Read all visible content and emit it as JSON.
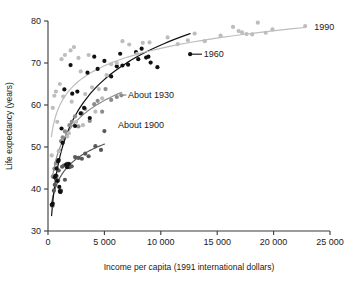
{
  "chart_data": {
    "type": "scatter",
    "title": "",
    "subtitle": "",
    "xlabel": "Income per capita (1991 international dollars)",
    "ylabel": "Life expectancy (years)",
    "xlim": [
      0,
      25000
    ],
    "ylim": [
      30,
      80
    ],
    "xticks": [
      0,
      5000,
      10000,
      15000,
      20000,
      25000
    ],
    "xticklabels": [
      "0",
      "5 000",
      "10 000",
      "15 000",
      "20 000",
      "25 000"
    ],
    "yticks": [
      30,
      40,
      50,
      60,
      70,
      80
    ],
    "yticklabels": [
      "30",
      "40",
      "50",
      "60",
      "70",
      "80"
    ],
    "grid": false,
    "legend_position": "inline-annotations",
    "annotations": [
      {
        "text": "1990",
        "x": 23600,
        "y": 78.6,
        "color": "#9a9a9a"
      },
      {
        "text": "1960",
        "x": 13800,
        "y": 72.1,
        "color": "#111111"
      },
      {
        "text": "About 1930",
        "x": 7100,
        "y": 62.4,
        "color": "#6e6e6e"
      },
      {
        "text": "About 1900",
        "x": 6200,
        "y": 55.2,
        "color": "#595959"
      }
    ],
    "series": [
      {
        "name": "About 1900",
        "color": "#595959",
        "marker": "circle",
        "curve_label": "About 1900",
        "curve_fit": "logarithmic",
        "points": [
          {
            "x": 330,
            "y": 36.3
          },
          {
            "x": 400,
            "y": 36.0
          },
          {
            "x": 520,
            "y": 39.6
          },
          {
            "x": 600,
            "y": 41.0
          },
          {
            "x": 700,
            "y": 42.4
          },
          {
            "x": 760,
            "y": 43.1
          },
          {
            "x": 900,
            "y": 42.0
          },
          {
            "x": 950,
            "y": 44.4
          },
          {
            "x": 1100,
            "y": 39.3
          },
          {
            "x": 1150,
            "y": 39.6
          },
          {
            "x": 1250,
            "y": 45.3
          },
          {
            "x": 1400,
            "y": 45.6
          },
          {
            "x": 1500,
            "y": 42.2
          },
          {
            "x": 1700,
            "y": 46.0
          },
          {
            "x": 1900,
            "y": 45.2
          },
          {
            "x": 2100,
            "y": 45.4
          },
          {
            "x": 2400,
            "y": 47.6
          },
          {
            "x": 2700,
            "y": 47.4
          },
          {
            "x": 3000,
            "y": 47.2
          },
          {
            "x": 3300,
            "y": 48.4
          },
          {
            "x": 3600,
            "y": 47.8
          },
          {
            "x": 4200,
            "y": 50.2
          },
          {
            "x": 4700,
            "y": 49.3
          },
          {
            "x": 5000,
            "y": 53.8
          }
        ]
      },
      {
        "name": "About 1930",
        "color": "#8c8c8c",
        "marker": "circle",
        "curve_label": "About 1930",
        "curve_fit": "logarithmic",
        "points": [
          {
            "x": 420,
            "y": 43.0
          },
          {
            "x": 560,
            "y": 44.8
          },
          {
            "x": 700,
            "y": 46.1
          },
          {
            "x": 850,
            "y": 46.8
          },
          {
            "x": 1000,
            "y": 49.1
          },
          {
            "x": 1150,
            "y": 51.4
          },
          {
            "x": 1300,
            "y": 52.3
          },
          {
            "x": 1500,
            "y": 53.7
          },
          {
            "x": 1700,
            "y": 53.1
          },
          {
            "x": 1900,
            "y": 55.2
          },
          {
            "x": 2100,
            "y": 56.0
          },
          {
            "x": 2400,
            "y": 57.3
          },
          {
            "x": 2700,
            "y": 54.9
          },
          {
            "x": 3000,
            "y": 58.0
          },
          {
            "x": 3300,
            "y": 59.1
          },
          {
            "x": 3700,
            "y": 56.2
          },
          {
            "x": 4100,
            "y": 60.2
          },
          {
            "x": 4400,
            "y": 61.0
          },
          {
            "x": 4800,
            "y": 58.4
          },
          {
            "x": 5100,
            "y": 63.8
          },
          {
            "x": 5600,
            "y": 61.2
          },
          {
            "x": 6100,
            "y": 61.9
          },
          {
            "x": 6500,
            "y": 62.3
          }
        ]
      },
      {
        "name": "1960",
        "color": "#111111",
        "marker": "circle",
        "curve_label": "1960",
        "curve_fit": "logarithmic",
        "points": [
          {
            "x": 350,
            "y": 36.2
          },
          {
            "x": 420,
            "y": 36.5
          },
          {
            "x": 600,
            "y": 42.8
          },
          {
            "x": 680,
            "y": 43.2
          },
          {
            "x": 760,
            "y": 44.9
          },
          {
            "x": 820,
            "y": 41.9
          },
          {
            "x": 900,
            "y": 46.6
          },
          {
            "x": 950,
            "y": 46.9
          },
          {
            "x": 1000,
            "y": 40.5
          },
          {
            "x": 1050,
            "y": 39.5
          },
          {
            "x": 1100,
            "y": 39.3
          },
          {
            "x": 1200,
            "y": 54.4
          },
          {
            "x": 1300,
            "y": 51.0
          },
          {
            "x": 1450,
            "y": 63.7
          },
          {
            "x": 1600,
            "y": 45.8
          },
          {
            "x": 1700,
            "y": 45.2
          },
          {
            "x": 1850,
            "y": 46.0
          },
          {
            "x": 2000,
            "y": 69.5
          },
          {
            "x": 2150,
            "y": 62.7
          },
          {
            "x": 2400,
            "y": 55.0
          },
          {
            "x": 2600,
            "y": 63.2
          },
          {
            "x": 2900,
            "y": 58.0
          },
          {
            "x": 3200,
            "y": 59.3
          },
          {
            "x": 3500,
            "y": 67.7
          },
          {
            "x": 3700,
            "y": 56.9
          },
          {
            "x": 4100,
            "y": 71.5
          },
          {
            "x": 4400,
            "y": 68.6
          },
          {
            "x": 5000,
            "y": 70.5
          },
          {
            "x": 5600,
            "y": 66.8
          },
          {
            "x": 6100,
            "y": 69.2
          },
          {
            "x": 6400,
            "y": 72.2
          },
          {
            "x": 6600,
            "y": 69.4
          },
          {
            "x": 7100,
            "y": 69.6
          },
          {
            "x": 7800,
            "y": 72.6
          },
          {
            "x": 8000,
            "y": 70.9
          },
          {
            "x": 8300,
            "y": 73.4
          },
          {
            "x": 8700,
            "y": 71.3
          },
          {
            "x": 8900,
            "y": 71.5
          },
          {
            "x": 9100,
            "y": 70.1
          },
          {
            "x": 9700,
            "y": 69.0
          },
          {
            "x": 12600,
            "y": 72.1
          }
        ]
      },
      {
        "name": "1990",
        "color": "#bdbdbd",
        "marker": "circle",
        "curve_label": "1990",
        "curve_fit": "logarithmic",
        "points": [
          {
            "x": 330,
            "y": 48.0
          },
          {
            "x": 420,
            "y": 59.3
          },
          {
            "x": 560,
            "y": 62.2
          },
          {
            "x": 700,
            "y": 63.2
          },
          {
            "x": 820,
            "y": 56.0
          },
          {
            "x": 950,
            "y": 49.0
          },
          {
            "x": 1050,
            "y": 65.0
          },
          {
            "x": 1200,
            "y": 70.9
          },
          {
            "x": 1350,
            "y": 62.0
          },
          {
            "x": 1500,
            "y": 71.9
          },
          {
            "x": 1700,
            "y": 52.5
          },
          {
            "x": 1850,
            "y": 53.3
          },
          {
            "x": 2000,
            "y": 73.0
          },
          {
            "x": 2100,
            "y": 60.8
          },
          {
            "x": 2300,
            "y": 73.8
          },
          {
            "x": 2500,
            "y": 56.0
          },
          {
            "x": 2700,
            "y": 71.2
          },
          {
            "x": 2900,
            "y": 68.0
          },
          {
            "x": 3100,
            "y": 55.2
          },
          {
            "x": 3300,
            "y": 62.6
          },
          {
            "x": 3600,
            "y": 71.9
          },
          {
            "x": 3900,
            "y": 64.2
          },
          {
            "x": 4200,
            "y": 58.4
          },
          {
            "x": 4500,
            "y": 63.8
          },
          {
            "x": 4800,
            "y": 61.6
          },
          {
            "x": 5200,
            "y": 67.1
          },
          {
            "x": 5600,
            "y": 69.7
          },
          {
            "x": 6100,
            "y": 70.0
          },
          {
            "x": 6600,
            "y": 75.2
          },
          {
            "x": 7200,
            "y": 74.4
          },
          {
            "x": 7900,
            "y": 72.2
          },
          {
            "x": 8400,
            "y": 74.8
          },
          {
            "x": 9000,
            "y": 74.9
          },
          {
            "x": 10600,
            "y": 76.1
          },
          {
            "x": 11500,
            "y": 74.5
          },
          {
            "x": 12400,
            "y": 75.4
          },
          {
            "x": 13000,
            "y": 77.0
          },
          {
            "x": 13900,
            "y": 75.2
          },
          {
            "x": 15300,
            "y": 76.5
          },
          {
            "x": 16400,
            "y": 78.6
          },
          {
            "x": 16900,
            "y": 77.6
          },
          {
            "x": 17200,
            "y": 77.3
          },
          {
            "x": 17600,
            "y": 76.9
          },
          {
            "x": 18100,
            "y": 76.8
          },
          {
            "x": 18600,
            "y": 79.6
          },
          {
            "x": 19300,
            "y": 77.2
          },
          {
            "x": 19900,
            "y": 78.0
          },
          {
            "x": 22800,
            "y": 78.8
          }
        ]
      }
    ]
  },
  "figure": {
    "background_color": "#ffffff",
    "axis_color": "#3a3a3a"
  }
}
